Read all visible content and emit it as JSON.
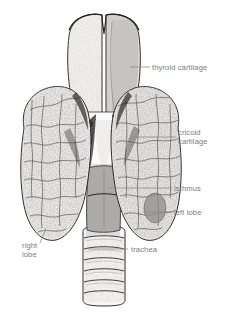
{
  "figure": {
    "style": "pen-and-ink stipple anatomical engraving",
    "background_color": "#ffffff",
    "label_color": "#7b7b7b",
    "leader_color": "#8c8c8c",
    "ink_color": "#1b1b1b"
  },
  "labels": {
    "thyroid_cartilage": "thyroid cartilage",
    "cricoid_line1": "cricoid",
    "cricoid_line2": "cartilage",
    "isthmus": "isthmus",
    "left_lobe": "left lobe",
    "right_lobe_line1": "right",
    "right_lobe_line2": "lobe",
    "trachea": "trachea"
  },
  "structures": [
    {
      "name": "thyroid-cartilage",
      "description": "shield-shaped laryngeal cartilage with superior thyroid notch, right lamina shaded"
    },
    {
      "name": "cricoid-cartilage",
      "description": "ring cartilage below thyroid cartilage, pale central band"
    },
    {
      "name": "cricothyroid-muscle",
      "description": "dark fan-shaped striated muscle fibers radiating bilaterally"
    },
    {
      "name": "right-lobe",
      "description": "large mottled lobe on viewer left"
    },
    {
      "name": "left-lobe",
      "description": "large mottled lobe on viewer right with darker nodule"
    },
    {
      "name": "isthmus",
      "description": "narrow darker band joining lobes across trachea"
    },
    {
      "name": "trachea",
      "description": "tube with seven horizontal cartilage rings descending below gland"
    }
  ],
  "leaders": [
    {
      "name": "leader-thyroid-cartilage",
      "x1": 130,
      "y1": 67,
      "x2": 150,
      "y2": 67
    },
    {
      "name": "leader-cricoid-cartilage",
      "x1": 132,
      "y1": 137,
      "x2": 176,
      "y2": 137
    },
    {
      "name": "leader-isthmus",
      "x1": 108,
      "y1": 188,
      "x2": 172,
      "y2": 188
    },
    {
      "name": "leader-left-lobe",
      "x1": 143,
      "y1": 212,
      "x2": 172,
      "y2": 212
    },
    {
      "name": "leader-right-lobe",
      "x1": 46,
      "y1": 228,
      "x2": 40,
      "y2": 243
    },
    {
      "name": "leader-trachea",
      "x1": 88,
      "y1": 249,
      "x2": 128,
      "y2": 249
    }
  ]
}
